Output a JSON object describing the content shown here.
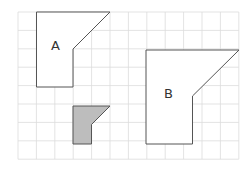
{
  "diagram": {
    "grid": {
      "x0": 18,
      "y0": 12,
      "cell": 18.4,
      "cols": 12,
      "rows": 8,
      "color": "#dcdcdc"
    },
    "shapes": [
      {
        "name": "A",
        "label": "A",
        "fill": "#ffffff",
        "stroke": "#555555",
        "points": [
          [
            36.5,
            12
          ],
          [
            110,
            12
          ],
          [
            73,
            49
          ],
          [
            73,
            87
          ],
          [
            36.5,
            87
          ]
        ],
        "label_pos": [
          51,
          50
        ]
      },
      {
        "name": "small",
        "label": "",
        "fill": "#bdbdbd",
        "stroke": "#555555",
        "points": [
          [
            73,
            106
          ],
          [
            110,
            106
          ],
          [
            91.5,
            124.5
          ],
          [
            91.5,
            144
          ],
          [
            73,
            144
          ]
        ]
      },
      {
        "name": "B",
        "label": "B",
        "fill": "#ffffff",
        "stroke": "#555555",
        "points": [
          [
            146,
            50
          ],
          [
            239,
            50
          ],
          [
            192.5,
            96
          ],
          [
            192.5,
            144
          ],
          [
            146,
            144
          ]
        ],
        "label_pos": [
          164,
          98
        ]
      }
    ]
  }
}
